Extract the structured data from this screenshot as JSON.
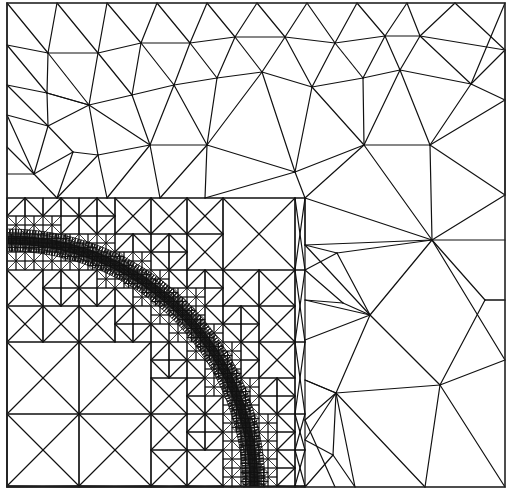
{
  "figure": {
    "type": "triangular finite-element mesh",
    "colors": {
      "background": "#ffffff",
      "line": "#111111"
    },
    "frame": {
      "x0": 7,
      "y0": 3,
      "x1": 505,
      "y1": 487
    },
    "arc": {
      "cx": 7,
      "cy": 487,
      "r_inner": 236,
      "r_outer": 258,
      "start_deg": 0,
      "end_deg": 90
    },
    "refinement_box": {
      "x0": 7,
      "y0": 198,
      "x1": 305,
      "y1": 487
    },
    "coarse_nodes": [
      [
        7,
        3
      ],
      [
        57,
        3
      ],
      [
        107,
        3
      ],
      [
        157,
        3
      ],
      [
        207,
        3
      ],
      [
        257,
        3
      ],
      [
        307,
        3
      ],
      [
        357,
        3
      ],
      [
        407,
        3
      ],
      [
        455,
        3
      ],
      [
        505,
        3
      ],
      [
        7,
        45
      ],
      [
        48,
        53
      ],
      [
        98,
        53
      ],
      [
        141,
        43
      ],
      [
        190,
        43
      ],
      [
        235,
        37
      ],
      [
        285,
        37
      ],
      [
        335,
        43
      ],
      [
        385,
        36
      ],
      [
        420,
        36
      ],
      [
        505,
        50
      ],
      [
        7,
        85
      ],
      [
        47,
        93
      ],
      [
        89,
        105
      ],
      [
        132,
        95
      ],
      [
        174,
        85
      ],
      [
        217,
        78
      ],
      [
        262,
        72
      ],
      [
        312,
        87
      ],
      [
        363,
        78
      ],
      [
        400,
        70
      ],
      [
        471,
        84
      ],
      [
        505,
        100
      ],
      [
        7,
        115
      ],
      [
        48,
        126
      ],
      [
        73,
        152
      ],
      [
        98,
        155
      ],
      [
        150,
        145
      ],
      [
        207,
        145
      ],
      [
        295,
        172
      ],
      [
        364,
        145
      ],
      [
        430,
        145
      ],
      [
        505,
        195
      ],
      [
        7,
        147
      ],
      [
        34,
        174
      ],
      [
        7,
        174
      ],
      [
        57,
        198
      ],
      [
        160,
        198
      ],
      [
        205,
        198
      ],
      [
        305,
        198
      ],
      [
        432,
        240
      ],
      [
        505,
        240
      ]
    ],
    "coarse_triangles": "generated"
  }
}
